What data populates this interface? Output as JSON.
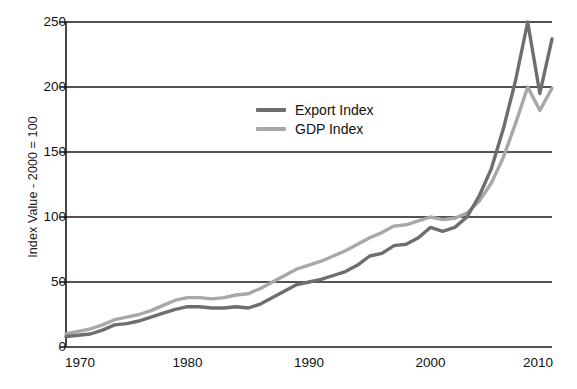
{
  "chart_data": {
    "type": "line",
    "title": "",
    "xlabel": "",
    "ylabel": "Index Value - 2000 = 100",
    "xlim": [
      1970,
      2010
    ],
    "ylim": [
      0,
      250
    ],
    "grid": true,
    "gridlines_y": [
      0,
      50,
      100,
      150,
      200,
      250
    ],
    "legend_position": "inside-upper-center",
    "ytick_labels": [
      "0",
      "50",
      "100",
      "150",
      "200",
      "250"
    ],
    "ytick_values": [
      0,
      50,
      100,
      150,
      200,
      250
    ],
    "xtick_labels": [
      "1970",
      "1980",
      "1990",
      "2000",
      "2010"
    ],
    "xtick_values": [
      1970,
      1980,
      1990,
      2000,
      2010
    ],
    "x": [
      1970,
      1971,
      1972,
      1973,
      1974,
      1975,
      1976,
      1977,
      1978,
      1979,
      1980,
      1981,
      1982,
      1983,
      1984,
      1985,
      1986,
      1987,
      1988,
      1989,
      1990,
      1991,
      1992,
      1993,
      1994,
      1995,
      1996,
      1997,
      1998,
      1999,
      2000,
      2001,
      2002,
      2003,
      2004,
      2005,
      2006,
      2007,
      2008,
      2009,
      2010
    ],
    "series": [
      {
        "name": "Export Index",
        "color": "#6e6e6e",
        "values": [
          8,
          9,
          10,
          13,
          17,
          18,
          20,
          23,
          26,
          29,
          31,
          31,
          30,
          30,
          31,
          30,
          33,
          38,
          43,
          48,
          50,
          52,
          55,
          58,
          63,
          70,
          72,
          78,
          79,
          84,
          92,
          89,
          92,
          100,
          116,
          137,
          168,
          205,
          250,
          195,
          237
        ]
      },
      {
        "name": "GDP Index",
        "color": "#a8a8a8",
        "values": [
          10,
          12,
          14,
          17,
          21,
          23,
          25,
          28,
          32,
          36,
          38,
          38,
          37,
          38,
          40,
          41,
          45,
          50,
          55,
          60,
          63,
          66,
          70,
          74,
          79,
          84,
          88,
          93,
          94,
          97,
          100,
          98,
          99,
          103,
          112,
          126,
          146,
          172,
          200,
          182,
          199
        ]
      }
    ]
  },
  "legend": {
    "items": [
      {
        "label": "Export Index",
        "color": "#6e6e6e"
      },
      {
        "label": "GDP Index",
        "color": "#a8a8a8"
      }
    ]
  },
  "axes": {
    "y_title": "Index Value - 2000 = 100"
  },
  "caption": {
    "text": ""
  }
}
